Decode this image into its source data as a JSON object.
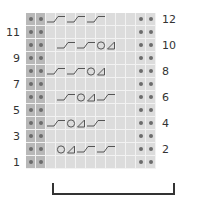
{
  "chart": {
    "title": "",
    "columns": 13,
    "rows": 12,
    "colors": {
      "cell_background": "#dcdcdc",
      "left_edge_background": "#b8b8b8",
      "dot": "#6c6c6c",
      "symbol_stroke": "#555555",
      "gridline": "#f2f2f2",
      "bracket": "#333333"
    },
    "row_labels": {
      "left": [
        "11",
        "9",
        "7",
        "5",
        "3",
        "1"
      ],
      "right": [
        "12",
        "10",
        "8",
        "6",
        "4",
        "2"
      ]
    },
    "legend_symbols": {
      "purl": "dot-icon",
      "cross": "cable-cross-icon",
      "yarn_over": "circle-yo-icon",
      "decrease": "triangle-decrease-icon"
    },
    "pattern_rows": [
      {
        "row": 12,
        "symbols": [
          {
            "type": "cross",
            "col": 2,
            "span": 2
          },
          {
            "type": "cross",
            "col": 4,
            "span": 2
          },
          {
            "type": "cross",
            "col": 6,
            "span": 2
          }
        ]
      },
      {
        "row": 11,
        "symbols": []
      },
      {
        "row": 10,
        "symbols": [
          {
            "type": "cross",
            "col": 3,
            "span": 2
          },
          {
            "type": "cross",
            "col": 5,
            "span": 2
          },
          {
            "type": "yo",
            "col": 7
          },
          {
            "type": "dec",
            "col": 8
          }
        ]
      },
      {
        "row": 9,
        "symbols": []
      },
      {
        "row": 8,
        "symbols": [
          {
            "type": "cross",
            "col": 2,
            "span": 2
          },
          {
            "type": "cross",
            "col": 4,
            "span": 2
          },
          {
            "type": "yo",
            "col": 6
          },
          {
            "type": "dec",
            "col": 7
          }
        ]
      },
      {
        "row": 7,
        "symbols": []
      },
      {
        "row": 6,
        "symbols": [
          {
            "type": "cross",
            "col": 3,
            "span": 2
          },
          {
            "type": "yo",
            "col": 5
          },
          {
            "type": "dec",
            "col": 6
          },
          {
            "type": "cross",
            "col": 7,
            "span": 2
          }
        ]
      },
      {
        "row": 5,
        "symbols": []
      },
      {
        "row": 4,
        "symbols": [
          {
            "type": "cross",
            "col": 2,
            "span": 2
          },
          {
            "type": "yo",
            "col": 4
          },
          {
            "type": "dec",
            "col": 5
          },
          {
            "type": "cross",
            "col": 6,
            "span": 2
          }
        ]
      },
      {
        "row": 3,
        "symbols": []
      },
      {
        "row": 2,
        "symbols": [
          {
            "type": "yo",
            "col": 3
          },
          {
            "type": "dec",
            "col": 4
          },
          {
            "type": "cross",
            "col": 5,
            "span": 2
          },
          {
            "type": "cross",
            "col": 7,
            "span": 2
          }
        ]
      },
      {
        "row": 1,
        "symbols": []
      }
    ],
    "repeat_bracket": {
      "label": ""
    }
  }
}
